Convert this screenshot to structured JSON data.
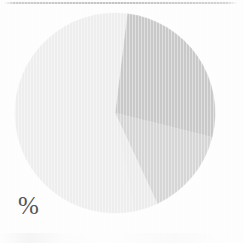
{
  "page": {
    "background_color": "#fdfdfd",
    "scan_line_color": "#bababa"
  },
  "label": {
    "percent_symbol": "%",
    "percent_color": "#555555"
  },
  "chart_data": {
    "type": "pie",
    "title": "",
    "subtitle": "",
    "xlabel": "",
    "ylabel": "",
    "legend": false,
    "legend_position": "none",
    "grid": false,
    "unit": "%",
    "axis_label_text": "%",
    "center": {
      "cx": 115,
      "cy": 113
    },
    "radius": 100,
    "start_angle_deg": -83,
    "direction": "clockwise",
    "categories": [
      "Slice 1",
      "Slice 2",
      "Slice 3",
      "Slice 4"
    ],
    "values": [
      27,
      14,
      4,
      55
    ],
    "colors": [
      "#c9c9c9",
      "#d6d6d6",
      "#ececec",
      "#eeeeee"
    ],
    "slices": [
      {
        "name": "Slice 1",
        "value": 27,
        "color": "#c9c9c9",
        "start_angle_deg": -83,
        "end_angle_deg": 14
      },
      {
        "name": "Slice 2",
        "value": 14,
        "color": "#d6d6d6",
        "start_angle_deg": 14,
        "end_angle_deg": 65
      },
      {
        "name": "Slice 3",
        "value": 4,
        "color": "#ececec",
        "start_angle_deg": 65,
        "end_angle_deg": 79
      },
      {
        "name": "Slice 4",
        "value": 55,
        "color": "#eeeeee",
        "start_angle_deg": 79,
        "end_angle_deg": 277
      }
    ]
  }
}
